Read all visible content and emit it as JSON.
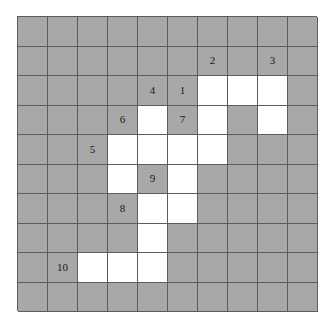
{
  "puzzle": {
    "type": "nonogram-style-shaded-grid",
    "rows": 10,
    "cols": 10,
    "colors": {
      "filled": "#a8a8a8",
      "empty": "#ffffff",
      "gridline": "#5d5d5d",
      "label": "#171717",
      "page_background": "#ffffff"
    },
    "legend": {
      "filled_meaning": "shaded cell",
      "empty_meaning": "white cell"
    },
    "grid": [
      [
        "filled",
        "filled",
        "filled",
        "filled",
        "filled",
        "filled",
        "filled",
        "filled",
        "filled",
        "filled"
      ],
      [
        "filled",
        "filled",
        "filled",
        "filled",
        "filled",
        "filled",
        "filled",
        "filled",
        "filled",
        "filled"
      ],
      [
        "filled",
        "filled",
        "filled",
        "filled",
        "filled",
        "filled",
        "empty",
        "empty",
        "empty",
        "filled"
      ],
      [
        "filled",
        "filled",
        "filled",
        "filled",
        "empty",
        "filled",
        "empty",
        "filled",
        "empty",
        "filled"
      ],
      [
        "filled",
        "filled",
        "filled",
        "empty",
        "empty",
        "empty",
        "empty",
        "filled",
        "filled",
        "filled"
      ],
      [
        "filled",
        "filled",
        "filled",
        "empty",
        "filled",
        "empty",
        "filled",
        "filled",
        "filled",
        "filled"
      ],
      [
        "filled",
        "filled",
        "filled",
        "filled",
        "empty",
        "empty",
        "filled",
        "filled",
        "filled",
        "filled"
      ],
      [
        "filled",
        "filled",
        "filled",
        "filled",
        "empty",
        "filled",
        "filled",
        "filled",
        "filled",
        "filled"
      ],
      [
        "filled",
        "filled",
        "empty",
        "empty",
        "empty",
        "filled",
        "filled",
        "filled",
        "filled",
        "filled"
      ],
      [
        "filled",
        "filled",
        "filled",
        "filled",
        "filled",
        "filled",
        "filled",
        "filled",
        "filled",
        "filled"
      ]
    ],
    "labels": [
      {
        "row": 1,
        "col": 6,
        "text": "2"
      },
      {
        "row": 1,
        "col": 8,
        "text": "3"
      },
      {
        "row": 2,
        "col": 4,
        "text": "4"
      },
      {
        "row": 2,
        "col": 5,
        "text": "1"
      },
      {
        "row": 3,
        "col": 3,
        "text": "6"
      },
      {
        "row": 3,
        "col": 5,
        "text": "7"
      },
      {
        "row": 4,
        "col": 2,
        "text": "5"
      },
      {
        "row": 5,
        "col": 4,
        "text": "9"
      },
      {
        "row": 6,
        "col": 3,
        "text": "8"
      },
      {
        "row": 8,
        "col": 1,
        "text": "10"
      }
    ],
    "label_sequence": [
      "1",
      "2",
      "3",
      "4",
      "5",
      "6",
      "7",
      "8",
      "9",
      "10"
    ]
  }
}
